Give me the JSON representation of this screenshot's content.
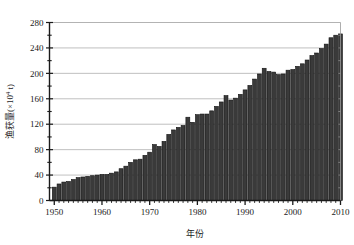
{
  "chart_data": {
    "type": "bar",
    "title": "",
    "subtitle": "",
    "xlabel": "年份",
    "ylabel": "渔获量(×10⁴ t)",
    "ylabel_parts": {
      "prefix": "渔获量(×10",
      "exponent": "4",
      "suffix": " t)"
    },
    "xlim": [
      1949,
      2010
    ],
    "ylim": [
      0,
      280
    ],
    "y_ticks": [
      0,
      40,
      80,
      120,
      160,
      200,
      240,
      280
    ],
    "y_tick_labels": [
      "0",
      "40",
      "80",
      "120",
      "160",
      "200",
      "240",
      "280"
    ],
    "y_minor_tick_step": 20,
    "x_ticks": [
      1950,
      1960,
      1970,
      1980,
      1990,
      2000,
      2010
    ],
    "x_tick_labels": [
      "1950",
      "1960",
      "1970",
      "1980",
      "1990",
      "2000",
      "2010"
    ],
    "x_minor_tick_step": 1,
    "grid": "horizontal",
    "legend": "none",
    "bar_color": "#3a3a3a",
    "bar_edge_color": "#111111",
    "axis_color": "#1a1a1a",
    "grid_color": "#b0b0b0",
    "background_color": "#ffffff",
    "categories": [
      1950,
      1951,
      1952,
      1953,
      1954,
      1955,
      1956,
      1957,
      1958,
      1959,
      1960,
      1961,
      1962,
      1963,
      1964,
      1965,
      1966,
      1967,
      1968,
      1969,
      1970,
      1971,
      1972,
      1973,
      1974,
      1975,
      1976,
      1977,
      1978,
      1979,
      1980,
      1981,
      1982,
      1983,
      1984,
      1985,
      1986,
      1987,
      1988,
      1989,
      1990,
      1991,
      1992,
      1993,
      1994,
      1995,
      1996,
      1997,
      1998,
      1999,
      2000,
      2001,
      2002,
      2003,
      2004,
      2005,
      2006,
      2007,
      2008,
      2009,
      2010
    ],
    "values": [
      21,
      26,
      29,
      30,
      33,
      36,
      37,
      38,
      39,
      40,
      41,
      41,
      43,
      45,
      50,
      54,
      60,
      64,
      65,
      71,
      76,
      88,
      85,
      93,
      104,
      111,
      115,
      118,
      131,
      123,
      135,
      136,
      136,
      141,
      148,
      155,
      165,
      158,
      161,
      167,
      174,
      181,
      191,
      199,
      208,
      203,
      202,
      198,
      199,
      205,
      206,
      211,
      215,
      221,
      228,
      232,
      239,
      246,
      256,
      260,
      262
    ],
    "series": [
      {
        "name": "渔获量",
        "values": [
          21,
          26,
          29,
          30,
          33,
          36,
          37,
          38,
          39,
          40,
          41,
          41,
          43,
          45,
          50,
          54,
          60,
          64,
          65,
          71,
          76,
          88,
          85,
          93,
          104,
          111,
          115,
          118,
          131,
          123,
          135,
          136,
          136,
          141,
          148,
          155,
          165,
          158,
          161,
          167,
          174,
          181,
          191,
          199,
          208,
          203,
          202,
          198,
          199,
          205,
          206,
          211,
          215,
          221,
          228,
          232,
          239,
          246,
          256,
          260,
          262
        ]
      }
    ],
    "units": "×10⁴ t",
    "annotations": []
  },
  "figure": {
    "name": "fishery-catch-bar-chart"
  }
}
